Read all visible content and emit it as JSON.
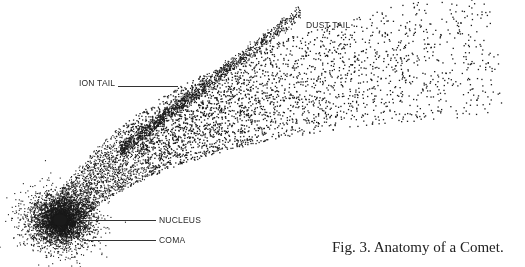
{
  "figure": {
    "caption": "Fig. 3.  Anatomy of a Comet.",
    "labels": {
      "ion_tail": "ION TAIL",
      "dust_tail": "DUST TAIL",
      "nucleus": "NUCLEUS",
      "coma": "COMA"
    },
    "colors": {
      "background": "#ffffff",
      "dots": "#1a1a1a",
      "text": "#2a2a2a"
    },
    "shape": {
      "nucleus_center": [
        60,
        220
      ],
      "ion_tail_end": [
        300,
        12
      ],
      "dust_tail_end": [
        498,
        50
      ]
    }
  }
}
